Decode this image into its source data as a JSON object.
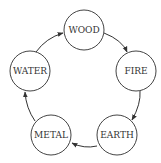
{
  "diagram": {
    "type": "cycle",
    "nodes": [
      {
        "id": "wood",
        "label": "WOOD",
        "cx": 84,
        "cy": 30,
        "r": 20
      },
      {
        "id": "fire",
        "label": "FIRE",
        "cx": 136,
        "cy": 71,
        "r": 20
      },
      {
        "id": "earth",
        "label": "EARTH",
        "cx": 117,
        "cy": 135,
        "r": 20
      },
      {
        "id": "metal",
        "label": "METAL",
        "cx": 51,
        "cy": 135,
        "r": 20
      },
      {
        "id": "water",
        "label": "WATER",
        "cx": 30,
        "cy": 71,
        "r": 20
      }
    ],
    "edges": [
      {
        "from": "wood",
        "to": "fire"
      },
      {
        "from": "fire",
        "to": "earth"
      },
      {
        "from": "earth",
        "to": "metal"
      },
      {
        "from": "metal",
        "to": "water"
      },
      {
        "from": "water",
        "to": "wood"
      }
    ],
    "colors": {
      "stroke": "#444444",
      "text": "#333333",
      "background": "#ffffff"
    }
  }
}
